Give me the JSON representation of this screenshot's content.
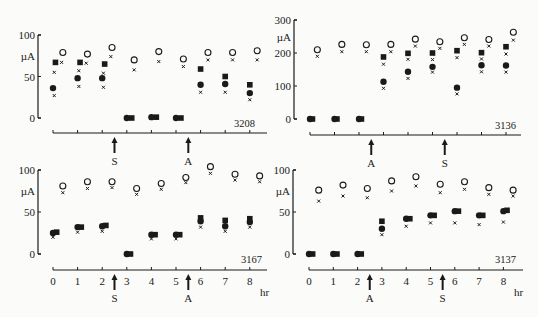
{
  "figure": {
    "units": "µA",
    "time_unit": "hr",
    "legend_note": "Symbols: open circle, filled circle, filled square, small cross (unlabeled in figure)"
  },
  "chart_data": [
    {
      "type": "scatter",
      "id": "3208",
      "panel_label": "3208",
      "ylabel": "µA",
      "xlabel": "",
      "ylim": [
        0,
        100
      ],
      "yticks": [
        "0",
        "50",
        "100"
      ],
      "x_ticks_labeled": false,
      "markers": [
        {
          "label": "S",
          "x": 2.5
        },
        {
          "label": "A",
          "x": 5.5
        }
      ],
      "series": [
        {
          "name": "open-circle",
          "x": [
            0.4,
            1.4,
            2.4,
            3.3,
            4.3,
            5.3,
            6.3,
            7.3,
            8.3
          ],
          "values": [
            79,
            77,
            85,
            70,
            80,
            71,
            79,
            79,
            81
          ]
        },
        {
          "name": "cross-high",
          "x": [
            0.35,
            1.35,
            2.35,
            3.3,
            4.3,
            5.3,
            6.3,
            7.3,
            8.3
          ],
          "values": [
            67,
            66,
            74,
            58,
            68,
            62,
            70,
            70,
            70
          ]
        },
        {
          "name": "filled-square",
          "x": [
            0.1,
            1.1,
            2.1,
            3.2,
            4.2,
            5.2,
            6.0,
            7.0,
            8.0
          ],
          "values": [
            67,
            67,
            65,
            0,
            1,
            0,
            59,
            50,
            40
          ]
        },
        {
          "name": "filled-circle",
          "x": [
            0.0,
            1.0,
            2.0,
            3.0,
            4.0,
            5.0,
            6.0,
            7.0,
            8.0
          ],
          "values": [
            36,
            48,
            48,
            0,
            1,
            0,
            40,
            41,
            30
          ]
        },
        {
          "name": "cross-low",
          "x": [
            0.05,
            1.05,
            2.05,
            6.0,
            7.0,
            8.0,
            0.05,
            1.05,
            2.05
          ],
          "values": [
            27,
            38,
            37,
            31,
            31,
            22,
            55,
            57,
            54
          ]
        }
      ]
    },
    {
      "type": "scatter",
      "id": "3136",
      "panel_label": "3136",
      "ylabel": "µA",
      "xlabel": "",
      "ylim": [
        0,
        300
      ],
      "yticks": [
        "0",
        "100",
        "200",
        "300"
      ],
      "x_ticks_labeled": false,
      "markers": [
        {
          "label": "A",
          "x": 2.5
        },
        {
          "label": "S",
          "x": 5.5
        }
      ],
      "series": [
        {
          "name": "open-circle",
          "x": [
            0.3,
            1.3,
            2.3,
            3.3,
            4.3,
            5.3,
            6.3,
            7.3,
            8.3
          ],
          "values": [
            210,
            226,
            225,
            226,
            242,
            234,
            246,
            241,
            263
          ]
        },
        {
          "name": "cross-high",
          "x": [
            0.3,
            1.3,
            2.3,
            3.3,
            4.3,
            5.3,
            6.3,
            7.3,
            8.3
          ],
          "values": [
            190,
            204,
            204,
            204,
            221,
            214,
            226,
            221,
            239
          ]
        },
        {
          "name": "filled-square",
          "x": [
            0.1,
            1.1,
            2.1,
            3.0,
            4.0,
            5.0,
            6.0,
            7.0,
            8.0
          ],
          "values": [
            0,
            0,
            0,
            188,
            199,
            200,
            207,
            201,
            219
          ]
        },
        {
          "name": "filled-circle",
          "x": [
            0.0,
            1.0,
            2.0,
            3.0,
            4.0,
            5.0,
            6.0,
            7.0,
            8.0
          ],
          "values": [
            0,
            0,
            0,
            113,
            143,
            158,
            95,
            163,
            162
          ]
        },
        {
          "name": "cross-mid",
          "x": [
            3.0,
            4.0,
            5.0,
            6.0,
            7.0,
            8.0
          ],
          "values": [
            166,
            181,
            180,
            186,
            182,
            197
          ]
        },
        {
          "name": "cross-low",
          "x": [
            3.0,
            4.0,
            5.0,
            6.0,
            7.0,
            8.0
          ],
          "values": [
            93,
            123,
            142,
            76,
            143,
            142
          ]
        }
      ]
    },
    {
      "type": "scatter",
      "id": "3167",
      "panel_label": "3167",
      "ylabel": "µA",
      "xlabel": "hr",
      "ylim": [
        0,
        100
      ],
      "yticks": [
        "0",
        "50",
        "100"
      ],
      "xticks": [
        "0",
        "1",
        "2",
        "3",
        "4",
        "5",
        "6",
        "7",
        "8"
      ],
      "markers": [
        {
          "label": "S",
          "x": 2.5
        },
        {
          "label": "A",
          "x": 5.5
        }
      ],
      "series": [
        {
          "name": "open-circle",
          "x": [
            0.4,
            1.4,
            2.4,
            3.4,
            4.4,
            5.4,
            6.4,
            7.4,
            8.4
          ],
          "values": [
            81,
            86,
            86,
            78,
            84,
            91,
            104,
            95,
            93
          ]
        },
        {
          "name": "cross-high",
          "x": [
            0.4,
            1.4,
            2.4,
            3.4,
            4.4,
            5.4,
            6.4,
            7.4,
            8.4
          ],
          "values": [
            73,
            78,
            79,
            71,
            77,
            85,
            96,
            88,
            86
          ]
        },
        {
          "name": "filled-square",
          "x": [
            0.15,
            1.15,
            2.15,
            3.15,
            4.15,
            5.15,
            6.0,
            7.0,
            8.0
          ],
          "values": [
            26,
            32,
            34,
            0,
            23,
            23,
            43,
            40,
            42
          ]
        },
        {
          "name": "filled-circle",
          "x": [
            0.0,
            1.0,
            2.0,
            3.0,
            4.0,
            5.0,
            6.0,
            7.0,
            8.0
          ],
          "values": [
            25,
            32,
            33,
            0,
            23,
            23,
            39,
            33,
            38
          ]
        },
        {
          "name": "cross-low",
          "x": [
            0.0,
            1.0,
            2.0,
            4.0,
            5.0,
            6.0,
            7.0,
            8.0
          ],
          "values": [
            20,
            26,
            27,
            18,
            18,
            32,
            27,
            32
          ]
        }
      ]
    },
    {
      "type": "scatter",
      "id": "3137",
      "panel_label": "3137",
      "ylabel": "µA",
      "xlabel": "hr",
      "ylim": [
        0,
        100
      ],
      "yticks": [
        "0",
        "50",
        "100"
      ],
      "xticks": [
        "0",
        "1",
        "2",
        "3",
        "4",
        "5",
        "6",
        "7",
        "8"
      ],
      "markers": [
        {
          "label": "A",
          "x": 2.5
        },
        {
          "label": "S",
          "x": 5.5
        }
      ],
      "series": [
        {
          "name": "open-circle",
          "x": [
            0.4,
            1.4,
            2.4,
            3.4,
            4.4,
            5.4,
            6.4,
            7.4,
            8.4
          ],
          "values": [
            76,
            82,
            78,
            87,
            92,
            83,
            86,
            79,
            76
          ]
        },
        {
          "name": "cross-high",
          "x": [
            0.4,
            1.4,
            2.4,
            3.4,
            4.4,
            5.4,
            6.4,
            7.4,
            8.4
          ],
          "values": [
            63,
            69,
            67,
            75,
            81,
            73,
            77,
            71,
            69
          ]
        },
        {
          "name": "filled-square",
          "x": [
            0.15,
            1.15,
            2.15,
            3.0,
            4.15,
            5.15,
            6.15,
            7.15,
            8.15
          ],
          "values": [
            0,
            0,
            0,
            39,
            42,
            46,
            51,
            46,
            52
          ]
        },
        {
          "name": "filled-circle",
          "x": [
            0.0,
            1.0,
            2.0,
            3.0,
            4.0,
            5.0,
            6.0,
            7.0,
            8.0
          ],
          "values": [
            0,
            0,
            0,
            30,
            42,
            46,
            51,
            46,
            51
          ]
        },
        {
          "name": "cross-low",
          "x": [
            3.0,
            4.0,
            5.0,
            6.0,
            7.0,
            8.0
          ],
          "values": [
            23,
            33,
            37,
            37,
            35,
            38
          ]
        }
      ]
    }
  ],
  "panels": [
    {
      "id": "3208",
      "ox": 38,
      "ax0": 53,
      "step": 24.6,
      "y0": 118,
      "ytop": 35,
      "ymax": 100,
      "axis_y": 133,
      "axis_end": 267,
      "ticks_labeled": false,
      "label_x": 255,
      "label_y": 127,
      "xlabel_show": false
    },
    {
      "id": "3136",
      "ox": 294,
      "ax0": 310,
      "step": 24.5,
      "y0": 119,
      "ytop": 20,
      "ymax": 300,
      "axis_y": 135,
      "axis_end": 521,
      "ticks_labeled": false,
      "label_x": 516,
      "label_y": 129,
      "xlabel_show": false
    },
    {
      "id": "3167",
      "ox": 38,
      "ax0": 53,
      "step": 24.6,
      "y0": 254,
      "ytop": 170,
      "ymax": 100,
      "axis_y": 270,
      "axis_end": 267,
      "ticks_labeled": true,
      "label_x": 262,
      "label_y": 263,
      "xlabel_show": true,
      "hr_x": 260,
      "hr_y": 296
    },
    {
      "id": "3137",
      "ox": 293,
      "ax0": 309,
      "step": 24.3,
      "y0": 254,
      "ytop": 170,
      "ymax": 100,
      "axis_y": 270,
      "axis_end": 523,
      "ticks_labeled": true,
      "label_x": 516,
      "label_y": 263,
      "xlabel_show": true,
      "hr_x": 514,
      "hr_y": 296
    }
  ]
}
